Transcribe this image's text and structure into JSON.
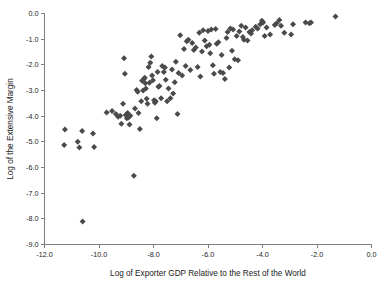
{
  "chart_data": {
    "type": "scatter",
    "title": "",
    "xlabel": "Log of Exporter GDP Relative to the Rest of the World",
    "ylabel": "Log of the Extensive Margin",
    "xlim": [
      -12.0,
      0.0
    ],
    "ylim": [
      -9.0,
      0.0
    ],
    "xticks": [
      "-12.0",
      "-10.0",
      "-8.0",
      "-6.0",
      "-4.0",
      "-2.0",
      "0.0"
    ],
    "xtick_values": [
      -12.0,
      -10.0,
      -8.0,
      -6.0,
      -4.0,
      -2.0,
      0.0
    ],
    "yticks": [
      "0.0",
      "-1.0",
      "-2.0",
      "-3.0",
      "-4.0",
      "-5.0",
      "-6.0",
      "-7.0",
      "-8.0",
      "-9.0"
    ],
    "ytick_values": [
      0.0,
      -1.0,
      -2.0,
      -3.0,
      -4.0,
      -5.0,
      -6.0,
      -7.0,
      -8.0,
      -9.0
    ],
    "grid": false,
    "legend": false,
    "marker": "diamond",
    "marker_color": "#4a4a4a",
    "marker_size": 4.2,
    "point_count": 140,
    "points": [
      [
        -11.25,
        -4.52
      ],
      [
        -11.28,
        -5.12
      ],
      [
        -10.78,
        -5.0
      ],
      [
        -10.72,
        -5.22
      ],
      [
        -10.62,
        -4.58
      ],
      [
        -10.6,
        -8.1
      ],
      [
        -10.22,
        -4.68
      ],
      [
        -10.18,
        -5.2
      ],
      [
        -9.72,
        -3.86
      ],
      [
        -9.52,
        -3.8
      ],
      [
        -9.38,
        -3.92
      ],
      [
        -9.3,
        -4.02
      ],
      [
        -9.22,
        -3.98
      ],
      [
        -9.18,
        -4.3
      ],
      [
        -9.12,
        -3.52
      ],
      [
        -9.08,
        -1.74
      ],
      [
        -9.05,
        -2.35
      ],
      [
        -9.02,
        -3.95
      ],
      [
        -8.98,
        -4.08
      ],
      [
        -8.95,
        -3.88
      ],
      [
        -8.92,
        -4.05
      ],
      [
        -8.88,
        -4.32
      ],
      [
        -8.85,
        -3.98
      ],
      [
        -8.72,
        -6.32
      ],
      [
        -8.68,
        -3.7
      ],
      [
        -8.62,
        -2.98
      ],
      [
        -8.58,
        -3.05
      ],
      [
        -8.55,
        -3.88
      ],
      [
        -8.5,
        -4.5
      ],
      [
        -8.45,
        -3.42
      ],
      [
        -8.42,
        -2.62
      ],
      [
        -8.38,
        -3.0
      ],
      [
        -8.35,
        -2.55
      ],
      [
        -8.32,
        -2.5
      ],
      [
        -8.3,
        -2.72
      ],
      [
        -8.28,
        -2.92
      ],
      [
        -8.25,
        -3.32
      ],
      [
        -8.22,
        -3.52
      ],
      [
        -8.18,
        -2.08
      ],
      [
        -8.15,
        -2.7
      ],
      [
        -8.12,
        -1.92
      ],
      [
        -8.08,
        -1.68
      ],
      [
        -8.05,
        -2.42
      ],
      [
        -8.02,
        -2.6
      ],
      [
        -7.98,
        -3.38
      ],
      [
        -7.95,
        -3.48
      ],
      [
        -7.92,
        -3.42
      ],
      [
        -7.88,
        -4.08
      ],
      [
        -7.85,
        -2.28
      ],
      [
        -7.82,
        -2.85
      ],
      [
        -7.78,
        -2.82
      ],
      [
        -7.72,
        -3.3
      ],
      [
        -7.68,
        -2.05
      ],
      [
        -7.62,
        -2.28
      ],
      [
        -7.58,
        -2.1
      ],
      [
        -7.55,
        -2.58
      ],
      [
        -7.5,
        -3.42
      ],
      [
        -7.45,
        -2.92
      ],
      [
        -7.38,
        -3.3
      ],
      [
        -7.32,
        -2.18
      ],
      [
        -7.28,
        -3.12
      ],
      [
        -7.22,
        -2.68
      ],
      [
        -7.18,
        -1.88
      ],
      [
        -7.12,
        -3.92
      ],
      [
        -7.08,
        -2.32
      ],
      [
        -7.02,
        -0.85
      ],
      [
        -6.95,
        -2.42
      ],
      [
        -6.88,
        -1.38
      ],
      [
        -6.82,
        -2.05
      ],
      [
        -6.78,
        -1.08
      ],
      [
        -6.72,
        -1.02
      ],
      [
        -6.65,
        -2.2
      ],
      [
        -6.58,
        -1.15
      ],
      [
        -6.52,
        -1.42
      ],
      [
        -6.45,
        -1.32
      ],
      [
        -6.38,
        -2.08
      ],
      [
        -6.32,
        -0.75
      ],
      [
        -6.28,
        -2.45
      ],
      [
        -6.22,
        -1.48
      ],
      [
        -6.18,
        -0.65
      ],
      [
        -6.12,
        -1.05
      ],
      [
        -6.05,
        -1.28
      ],
      [
        -6.0,
        -0.68
      ],
      [
        -5.95,
        -1.22
      ],
      [
        -5.92,
        -1.55
      ],
      [
        -5.88,
        -0.62
      ],
      [
        -5.82,
        -2.02
      ],
      [
        -5.78,
        -2.35
      ],
      [
        -5.72,
        -0.6
      ],
      [
        -5.68,
        -1.18
      ],
      [
        -5.62,
        -1.12
      ],
      [
        -5.55,
        -2.28
      ],
      [
        -5.5,
        -1.62
      ],
      [
        -5.45,
        -2.32
      ],
      [
        -5.38,
        -2.55
      ],
      [
        -5.32,
        -0.95
      ],
      [
        -5.28,
        -0.72
      ],
      [
        -5.22,
        -2.1
      ],
      [
        -5.18,
        -0.58
      ],
      [
        -5.12,
        -1.45
      ],
      [
        -5.08,
        -0.62
      ],
      [
        -5.02,
        -1.78
      ],
      [
        -4.95,
        -0.88
      ],
      [
        -4.9,
        -1.82
      ],
      [
        -4.85,
        -0.7
      ],
      [
        -4.78,
        -0.48
      ],
      [
        -4.72,
        -0.92
      ],
      [
        -4.68,
        -1.02
      ],
      [
        -4.62,
        -0.55
      ],
      [
        -4.55,
        -1.05
      ],
      [
        -4.48,
        -0.72
      ],
      [
        -4.42,
        -0.78
      ],
      [
        -4.38,
        -0.65
      ],
      [
        -4.25,
        -0.52
      ],
      [
        -4.18,
        -0.58
      ],
      [
        -4.08,
        -0.42
      ],
      [
        -4.02,
        -0.28
      ],
      [
        -3.98,
        -0.35
      ],
      [
        -3.92,
        -0.88
      ],
      [
        -3.85,
        -0.55
      ],
      [
        -3.72,
        -0.82
      ],
      [
        -3.55,
        -0.45
      ],
      [
        -3.48,
        -0.38
      ],
      [
        -3.38,
        -0.25
      ],
      [
        -3.32,
        -0.48
      ],
      [
        -3.2,
        -0.75
      ],
      [
        -2.95,
        -0.82
      ],
      [
        -2.88,
        -0.42
      ],
      [
        -2.42,
        -0.35
      ],
      [
        -2.28,
        -0.38
      ],
      [
        -2.22,
        -0.35
      ],
      [
        -1.32,
        -0.12
      ]
    ]
  }
}
